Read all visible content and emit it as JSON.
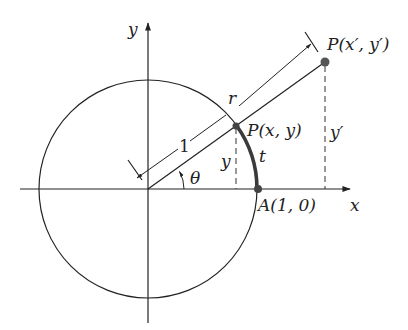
{
  "diagram": {
    "type": "unit-circle-trig-definition",
    "colors": {
      "stroke": "#222222",
      "arc_highlight": "#3a3a3a",
      "point_fill": "#555555",
      "dashed": "#333333",
      "background": "#ffffff"
    },
    "axes": {
      "x_label": "x",
      "y_label": "y"
    },
    "circle": {
      "radius_label": "1"
    },
    "points": {
      "P": {
        "label": "P(x, y)"
      },
      "P_prime": {
        "label": "P(x′, y′)"
      },
      "A": {
        "label": "A(1, 0)"
      }
    },
    "labels": {
      "angle": "θ",
      "arc": "t",
      "radius_r": "r",
      "unit": "1",
      "y_segment": "y",
      "y_prime_segment": "y′"
    }
  }
}
